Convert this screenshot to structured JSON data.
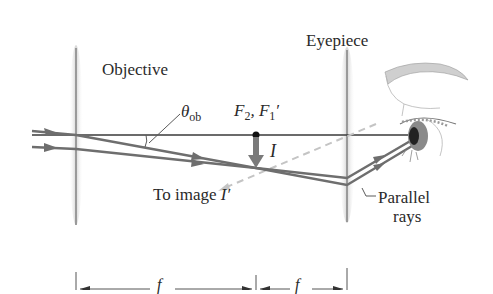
{
  "diagram": {
    "labels": {
      "objective": "Objective",
      "eyepiece": "Eyepiece",
      "theta_symbol": "θ",
      "theta_sub": "ob",
      "focus_f2": "F",
      "focus_f2_sub": "2",
      "focus_sep": ", ",
      "focus_f1": "F",
      "focus_f1_sub": "1",
      "focus_f1_prime": "′",
      "image": "I",
      "to_image_text": "To image ",
      "to_image_symbol": "I′",
      "parallel": "Parallel",
      "rays": "rays",
      "f_ob": "f",
      "f_eye": "f"
    },
    "colors": {
      "ray": "#6e6e6e",
      "axis": "#3a3a3a",
      "lens": "#d8d8d8",
      "dashed": "#c4c4c4",
      "text": "#2a2a2a"
    },
    "geometry": {
      "axis_y": 135,
      "objective_x": 76,
      "eyepiece_x": 347,
      "focal_point_x": 256,
      "image_tip_y": 168
    }
  }
}
